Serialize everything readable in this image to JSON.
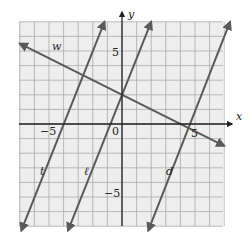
{
  "chart_data": {
    "type": "line",
    "title": "",
    "xlabel": "x",
    "ylabel": "y",
    "xlim": [
      -7,
      7
    ],
    "ylim": [
      -7,
      7
    ],
    "grid": true,
    "tick_labels": {
      "x": [
        "-5",
        "0",
        "5"
      ],
      "y": [
        "5",
        "-5"
      ]
    },
    "series": [
      {
        "name": "w",
        "slope": -0.5,
        "intercept": 2,
        "points": [
          [
            -7,
            5.5
          ],
          [
            7,
            -1.5
          ]
        ]
      },
      {
        "name": "t",
        "slope": 2.5,
        "intercept": 10,
        "points": [
          [
            -6.9,
            -7.3
          ],
          [
            -1.2,
            7
          ]
        ]
      },
      {
        "name": "ℓ",
        "slope": 2.5,
        "intercept": 2,
        "points": [
          [
            -3.7,
            -7.3
          ],
          [
            2,
            7
          ]
        ]
      },
      {
        "name": "d",
        "slope": 2.5,
        "intercept": -11.5,
        "points": [
          [
            1.8,
            -7.3
          ],
          [
            7.4,
            7
          ]
        ]
      }
    ],
    "colors": {
      "lines": "#5a5a5a",
      "grid": "#aaaaaa",
      "axes": "#222222",
      "background": "#eeeeee"
    }
  },
  "labels": {
    "x_axis": "x",
    "y_axis": "y",
    "tick_x_neg5": "−5",
    "tick_x_0": "0",
    "tick_x_5": "5",
    "tick_y_5": "5",
    "tick_y_neg5": "−5",
    "line_w": "w",
    "line_t": "t",
    "line_l": "ℓ",
    "line_d": "d"
  }
}
